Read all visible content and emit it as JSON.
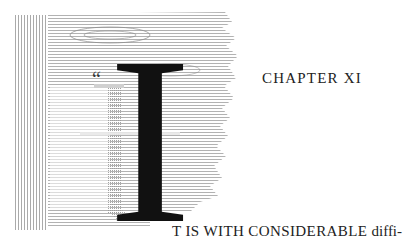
{
  "chapter": {
    "heading": "CHAPTER XI",
    "opening_quote": "“",
    "drop_cap": "I",
    "first_line_caps": "T IS WITH CONSIDERABLE ",
    "first_line_rest": "diffi-"
  },
  "illustration": {
    "name": "wood-grain-frame",
    "colors": {
      "grain": "#8f8f8f",
      "grain_light": "#c8c8c8",
      "ink": "#111111"
    }
  }
}
